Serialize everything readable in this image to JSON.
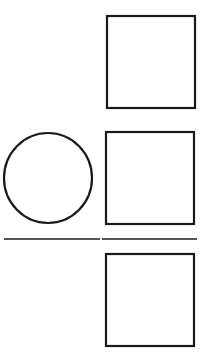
{
  "diagram": {
    "width": 208,
    "height": 353,
    "background": "#ffffff",
    "stroke_color": "#1a1a1a",
    "shapes": [
      {
        "type": "square",
        "name": "square-top-right",
        "x": 107,
        "y": 16,
        "w": 88,
        "h": 92
      },
      {
        "type": "circle",
        "name": "circle-middle-left",
        "cx": 48,
        "cy": 178,
        "rx": 44,
        "ry": 45
      },
      {
        "type": "square",
        "name": "square-middle-right",
        "x": 106,
        "y": 132,
        "w": 88,
        "h": 92
      },
      {
        "type": "line",
        "name": "divider-line-left",
        "x1": 4,
        "y1": 239,
        "x2": 100,
        "y2": 239
      },
      {
        "type": "line",
        "name": "divider-line-right",
        "x1": 102,
        "y1": 239,
        "x2": 197,
        "y2": 239
      },
      {
        "type": "square",
        "name": "square-bottom-right",
        "x": 106,
        "y": 254,
        "w": 88,
        "h": 92
      }
    ]
  }
}
